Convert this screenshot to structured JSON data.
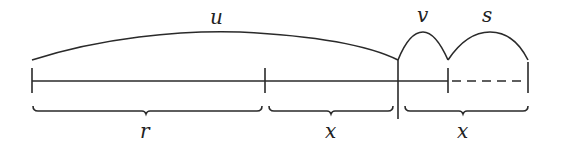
{
  "diagram": {
    "type": "number-line segment diagram",
    "colors": {
      "ink": "#2a2a2a",
      "background": "#ffffff"
    },
    "arcs": [
      {
        "id": "u",
        "label": "u",
        "from_x": 32,
        "to_x": 398
      },
      {
        "id": "v",
        "label": "v",
        "from_x": 398,
        "to_x": 448
      },
      {
        "id": "s",
        "label": "s",
        "from_x": 448,
        "to_x": 528
      }
    ],
    "line": {
      "solid_from": 32,
      "solid_to": 448,
      "dashed_from": 448,
      "dashed_to": 528
    },
    "ticks": [
      32,
      265,
      398,
      448,
      528
    ],
    "braces": [
      {
        "id": "r",
        "label": "r",
        "from_x": 33,
        "to_x": 262
      },
      {
        "id": "x1",
        "label": "x",
        "from_x": 269,
        "to_x": 393
      },
      {
        "id": "x2",
        "label": "x",
        "from_x": 405,
        "to_x": 528
      }
    ]
  }
}
